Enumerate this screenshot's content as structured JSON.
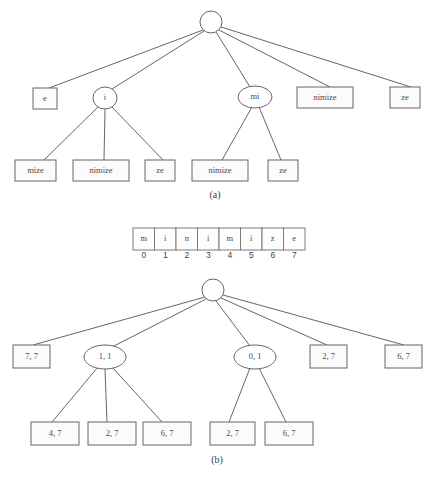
{
  "figure": {
    "width": 439,
    "height": 477,
    "background": "#ffffff",
    "line_color": "#555555",
    "node_stroke": "#666666",
    "text_color": "#4a4a4a"
  },
  "panel_a": {
    "caption": "(a)",
    "caption_x": 215,
    "caption_y": 196,
    "root": {
      "type": "circle",
      "label": "",
      "cx": 211,
      "cy": 22,
      "r": 11
    },
    "nodes": [
      {
        "id": "a-e",
        "type": "box",
        "label": "e",
        "x": 33,
        "y": 88,
        "w": 24,
        "h": 21
      },
      {
        "id": "a-i",
        "type": "ellipse",
        "label": "i",
        "cx": 105,
        "cy": 98,
        "rx": 12,
        "ry": 11
      },
      {
        "id": "a-mi",
        "type": "ellipse",
        "label": "mi",
        "cx": 255,
        "cy": 97,
        "rx": 17,
        "ry": 11
      },
      {
        "id": "a-nimize-1",
        "type": "box",
        "label": "nimize",
        "x": 297,
        "y": 87,
        "w": 56,
        "h": 21
      },
      {
        "id": "a-ze-1",
        "type": "box",
        "label": "ze",
        "x": 390,
        "y": 87,
        "w": 30,
        "h": 21
      },
      {
        "id": "a-mize",
        "type": "box",
        "label": "mize",
        "x": 15,
        "y": 160,
        "w": 41,
        "h": 21
      },
      {
        "id": "a-nimize-2",
        "type": "box",
        "label": "nimize",
        "x": 73,
        "y": 160,
        "w": 56,
        "h": 21
      },
      {
        "id": "a-ze-2",
        "type": "box",
        "label": "ze",
        "x": 145,
        "y": 160,
        "w": 30,
        "h": 21
      },
      {
        "id": "a-nimize-3",
        "type": "box",
        "label": "nimize",
        "x": 192,
        "y": 160,
        "w": 56,
        "h": 21
      },
      {
        "id": "a-ze-3",
        "type": "box",
        "label": "ze",
        "x": 268,
        "y": 160,
        "w": 30,
        "h": 21
      }
    ],
    "edges": [
      {
        "from": "root",
        "to": "a-e",
        "x1": 203,
        "y1": 30,
        "x2": 49,
        "y2": 88
      },
      {
        "from": "root",
        "to": "a-i",
        "x1": 204,
        "y1": 31,
        "x2": 112,
        "y2": 89
      },
      {
        "from": "root",
        "to": "a-mi",
        "x1": 216,
        "y1": 32,
        "x2": 250,
        "y2": 87
      },
      {
        "from": "root",
        "to": "a-nimize-1",
        "x1": 219,
        "y1": 30,
        "x2": 330,
        "y2": 87
      },
      {
        "from": "root",
        "to": "a-ze-1",
        "x1": 221,
        "y1": 27,
        "x2": 411,
        "y2": 87
      },
      {
        "from": "a-i",
        "to": "a-mize",
        "x1": 99,
        "y1": 106,
        "x2": 44,
        "y2": 160
      },
      {
        "from": "a-i",
        "to": "a-nimize-2",
        "x1": 105,
        "y1": 109,
        "x2": 104,
        "y2": 160
      },
      {
        "from": "a-i",
        "to": "a-ze-2",
        "x1": 111,
        "y1": 106,
        "x2": 163,
        "y2": 160
      },
      {
        "from": "a-mi",
        "to": "a-nimize-3",
        "x1": 252,
        "y1": 107,
        "x2": 222,
        "y2": 160
      },
      {
        "from": "a-mi",
        "to": "a-ze-3",
        "x1": 259,
        "y1": 107,
        "x2": 281,
        "y2": 160
      }
    ]
  },
  "string_table": {
    "x": 133,
    "y": 228,
    "cell_width": 21.5,
    "cell_height": 22,
    "index_y": 256,
    "cells": [
      "m",
      "i",
      "n",
      "i",
      "m",
      "i",
      "z",
      "e"
    ],
    "indices": [
      "0",
      "1",
      "2",
      "3",
      "4",
      "5",
      "6",
      "7"
    ]
  },
  "panel_b": {
    "caption": "(b)",
    "caption_x": 217,
    "caption_y": 461,
    "root": {
      "type": "circle",
      "label": "",
      "cx": 213,
      "cy": 290,
      "r": 11
    },
    "nodes": [
      {
        "id": "b-77",
        "type": "box",
        "label": "7, 7",
        "x": 13,
        "y": 345,
        "w": 37,
        "h": 23
      },
      {
        "id": "b-11",
        "type": "ellipse",
        "label": "1, 1",
        "cx": 105,
        "cy": 357,
        "rx": 21,
        "ry": 12
      },
      {
        "id": "b-01",
        "type": "ellipse",
        "label": "0, 1",
        "cx": 255,
        "cy": 357,
        "rx": 21,
        "ry": 12
      },
      {
        "id": "b-27-a",
        "type": "box",
        "label": "2, 7",
        "x": 310,
        "y": 345,
        "w": 37,
        "h": 23
      },
      {
        "id": "b-67-a",
        "type": "box",
        "label": "6, 7",
        "x": 385,
        "y": 345,
        "w": 37,
        "h": 23
      },
      {
        "id": "b-47",
        "type": "box",
        "label": "4, 7",
        "x": 31,
        "y": 422,
        "w": 48,
        "h": 23
      },
      {
        "id": "b-27-b",
        "type": "box",
        "label": "2, 7",
        "x": 88,
        "y": 422,
        "w": 48,
        "h": 23
      },
      {
        "id": "b-67-b",
        "type": "box",
        "label": "6, 7",
        "x": 143,
        "y": 422,
        "w": 48,
        "h": 23
      },
      {
        "id": "b-27-c",
        "type": "box",
        "label": "2, 7",
        "x": 210,
        "y": 422,
        "w": 45,
        "h": 23
      },
      {
        "id": "b-67-c",
        "type": "box",
        "label": "6, 7",
        "x": 265,
        "y": 422,
        "w": 48,
        "h": 23
      }
    ],
    "edges": [
      {
        "from": "root",
        "to": "b-77",
        "x1": 205,
        "y1": 297,
        "x2": 33,
        "y2": 345
      },
      {
        "from": "root",
        "to": "b-11",
        "x1": 206,
        "y1": 299,
        "x2": 112,
        "y2": 347
      },
      {
        "from": "root",
        "to": "b-01",
        "x1": 216,
        "y1": 301,
        "x2": 250,
        "y2": 346
      },
      {
        "from": "root",
        "to": "b-27-a",
        "x1": 221,
        "y1": 298,
        "x2": 327,
        "y2": 345
      },
      {
        "from": "root",
        "to": "b-67-a",
        "x1": 223,
        "y1": 295,
        "x2": 404,
        "y2": 345
      },
      {
        "from": "b-11",
        "to": "b-47",
        "x1": 98,
        "y1": 367,
        "x2": 52,
        "y2": 422
      },
      {
        "from": "b-11",
        "to": "b-27-b",
        "x1": 105,
        "y1": 369,
        "x2": 107,
        "y2": 422
      },
      {
        "from": "b-11",
        "to": "b-67-b",
        "x1": 112,
        "y1": 367,
        "x2": 162,
        "y2": 422
      },
      {
        "from": "b-01",
        "to": "b-27-c",
        "x1": 250,
        "y1": 368,
        "x2": 229,
        "y2": 422
      },
      {
        "from": "b-01",
        "to": "b-67-c",
        "x1": 259,
        "y1": 368,
        "x2": 286,
        "y2": 422
      }
    ]
  }
}
